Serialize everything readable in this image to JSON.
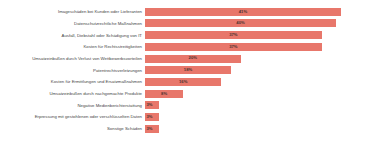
{
  "chart_data": {
    "type": "bar",
    "orientation": "horizontal",
    "title": "",
    "subtitle": "",
    "xlabel": "",
    "ylabel": "",
    "xlim": [
      0,
      45
    ],
    "grid": false,
    "legend": false,
    "value_suffix": "%",
    "bar_color": "#e8776b",
    "label_color": "#3f3f3f",
    "value_color": "#4a3230",
    "background": "#ffffff",
    "categories": [
      "Imageschäden bei Kunden oder Lieferanten",
      "Datenschutzrechtliche Maßnahmen",
      "Ausfall, Diebstahl oder Schädigung von IT",
      "Kosten für Rechtsstreitigkeiten",
      "Umsatzeinbußen durch Verlust von Wettbewerbsvorteilen",
      "Patentrechtsverletzungen",
      "Kosten für Ermittlungen und Ersatzmaßnahmen",
      "Umsatzeinbußen durch nachgemachte Produkte",
      "Negative Medienberichterstattung",
      "Erpressung mit gestohlenen oder verschlüsselten Daten",
      "Sonstige Schäden"
    ],
    "values": [
      41,
      40,
      37,
      37,
      20,
      18,
      16,
      8,
      3,
      3,
      3
    ],
    "value_labels": [
      "41%",
      "40%",
      "37%",
      "37%",
      "20%",
      "18%",
      "16%",
      "8%",
      "3%",
      "3%",
      "3%"
    ]
  }
}
